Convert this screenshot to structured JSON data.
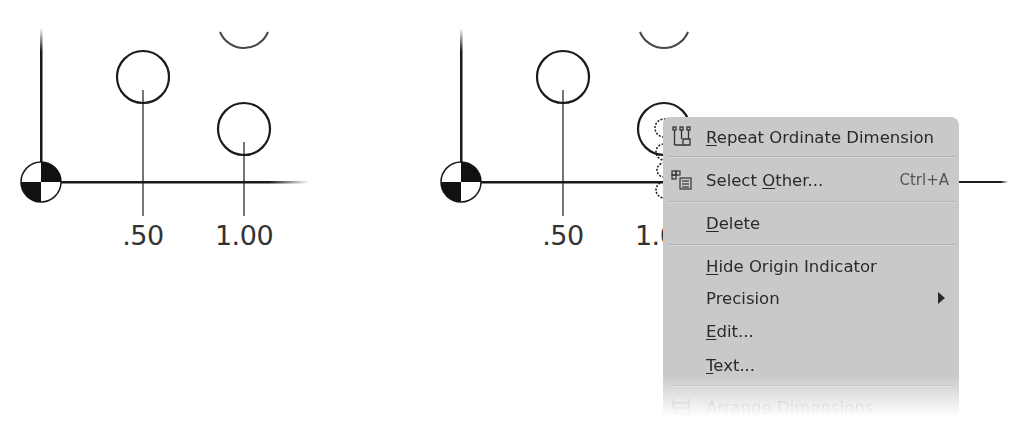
{
  "left_view": {
    "labels": [
      ".50",
      "1.00"
    ]
  },
  "right_view": {
    "labels": [
      ".50",
      "1.00"
    ]
  },
  "context_menu": {
    "items": [
      {
        "pre": "",
        "mnemonic": "R",
        "post": "epeat Ordinate Dimension",
        "icon": "repeat-ordinate-dimension-icon",
        "shortcut": ""
      },
      {
        "pre": "Select ",
        "mnemonic": "O",
        "post": "ther...",
        "icon": "select-other-icon",
        "shortcut": "Ctrl+A"
      },
      {
        "pre": "",
        "mnemonic": "D",
        "post": "elete",
        "icon": "",
        "shortcut": ""
      },
      {
        "pre": "",
        "mnemonic": "H",
        "post": "ide Origin Indicator",
        "icon": "",
        "shortcut": ""
      },
      {
        "pre": "Precision",
        "mnemonic": "",
        "post": "",
        "icon": "",
        "shortcut": "",
        "submenu": true
      },
      {
        "pre": "",
        "mnemonic": "E",
        "post": "dit...",
        "icon": "",
        "shortcut": ""
      },
      {
        "pre": "",
        "mnemonic": "T",
        "post": "ext...",
        "icon": "",
        "shortcut": ""
      },
      {
        "pre": "Arrange Dimensions",
        "mnemonic": "",
        "post": "",
        "icon": "arrange-dimensions-icon",
        "shortcut": ""
      }
    ]
  },
  "colors": {
    "menu_bg": "#c9c9c9",
    "line": "#1a1a1a",
    "text": "#2a2a2a"
  }
}
